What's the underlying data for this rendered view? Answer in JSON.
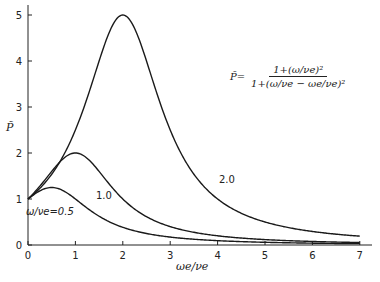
{
  "chart_data": {
    "type": "line",
    "title": "",
    "xlabel": "ωe/νe",
    "ylabel": "P̃",
    "xlim": [
      0,
      7
    ],
    "ylim": [
      0,
      5
    ],
    "x_ticks": [
      "0",
      "1",
      "2",
      "3",
      "4",
      "5",
      "6",
      "7"
    ],
    "y_ticks": [
      "0",
      "1",
      "2",
      "3",
      "4",
      "5"
    ],
    "grid": false,
    "legend": "inline curve labels",
    "formula": {
      "lhs": "P̃=",
      "numerator": "1+(ω/νe)²",
      "denominator": "1+(ω/νe − ωe/νe)²"
    },
    "x": [
      0,
      0.5,
      1,
      1.5,
      2,
      2.5,
      3,
      3.5,
      4,
      4.5,
      5,
      5.5,
      6,
      6.5,
      7
    ],
    "series": [
      {
        "name": "ω/νe=0.5",
        "label": "ω/νe=0.5",
        "param": 0.5,
        "values": [
          1.0,
          1.25,
          1.0,
          0.625,
          0.385,
          0.25,
          0.172,
          0.125,
          0.094,
          0.074,
          0.06,
          0.05,
          0.041,
          0.035,
          0.03
        ]
      },
      {
        "name": "1.0",
        "label": "1.0",
        "param": 1.0,
        "values": [
          1.0,
          1.6,
          2.0,
          1.6,
          1.0,
          0.615,
          0.4,
          0.276,
          0.2,
          0.151,
          0.118,
          0.094,
          0.077,
          0.064,
          0.054
        ]
      },
      {
        "name": "2.0",
        "label": "2.0",
        "param": 2.0,
        "values": [
          1.0,
          1.655,
          2.5,
          3.846,
          5.0,
          4.0,
          2.5,
          1.538,
          1.0,
          0.69,
          0.5,
          0.377,
          0.294,
          0.235,
          0.192
        ]
      }
    ]
  }
}
